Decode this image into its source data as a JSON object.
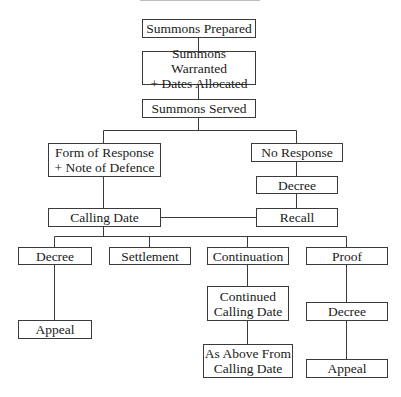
{
  "diagram": {
    "type": "flowchart",
    "nodes": {
      "summons_prepared": "Summons Prepared",
      "summons_warranted": "Summons Warranted\n+ Dates Allocated",
      "summons_served": "Summons Served",
      "form_of_response": "Form of Response\n+ Note of Defence",
      "no_response": "No Response",
      "decree_default": "Decree",
      "calling_date": "Calling Date",
      "recall": "Recall",
      "decree": "Decree",
      "settlement": "Settlement",
      "continuation": "Continuation",
      "proof": "Proof",
      "appeal_left": "Appeal",
      "continued_calling_date": "Continued\nCalling Date",
      "as_above": "As Above From\nCalling Date",
      "decree_proof": "Decree",
      "appeal_right": "Appeal"
    },
    "edges": [
      [
        "summons_prepared",
        "summons_warranted"
      ],
      [
        "summons_warranted",
        "summons_served"
      ],
      [
        "summons_served",
        "form_of_response"
      ],
      [
        "summons_served",
        "no_response"
      ],
      [
        "no_response",
        "decree_default"
      ],
      [
        "decree_default",
        "recall"
      ],
      [
        "form_of_response",
        "calling_date"
      ],
      [
        "recall",
        "calling_date"
      ],
      [
        "calling_date",
        "decree"
      ],
      [
        "calling_date",
        "settlement"
      ],
      [
        "calling_date",
        "continuation"
      ],
      [
        "calling_date",
        "proof"
      ],
      [
        "decree",
        "appeal_left"
      ],
      [
        "continuation",
        "continued_calling_date"
      ],
      [
        "continued_calling_date",
        "as_above"
      ],
      [
        "proof",
        "decree_proof"
      ],
      [
        "decree_proof",
        "appeal_right"
      ]
    ]
  }
}
